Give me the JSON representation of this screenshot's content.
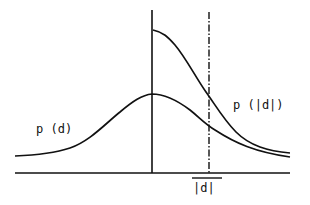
{
  "diagram": {
    "labels": {
      "p_d": "p (d)",
      "p_abs_d": "p (|d|)",
      "abs_d": "|d|"
    },
    "curves": [
      {
        "name": "p(d)",
        "description": "symmetric bell-shaped density centered at vertical axis"
      },
      {
        "name": "p(|d|)",
        "description": "folded density starting at twice the peak height at the axis, decaying to the right"
      }
    ],
    "markers": {
      "vertical_axis": "solid",
      "threshold_line": "dash-dot at |d|"
    },
    "colors": {
      "stroke": "#111111",
      "background": "#ffffff"
    }
  }
}
